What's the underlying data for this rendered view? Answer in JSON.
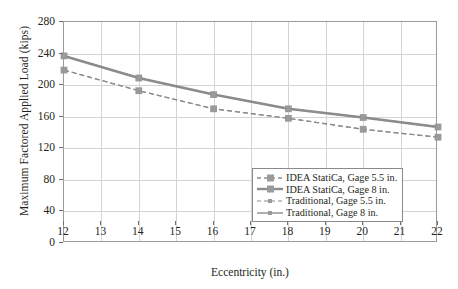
{
  "chart_data": {
    "type": "line",
    "title": "",
    "xlabel": "Eccentricity (in.)",
    "ylabel": "Maximum Factored Applied Load (kips)",
    "x": [
      12,
      14,
      16,
      18,
      20,
      22
    ],
    "xlim": [
      12,
      22
    ],
    "ylim": [
      0,
      280
    ],
    "xticks": [
      "12",
      "13",
      "14",
      "15",
      "16",
      "17",
      "18",
      "19",
      "20",
      "21",
      "22"
    ],
    "yticks": [
      "0",
      "40",
      "80",
      "120",
      "160",
      "200",
      "240",
      "280"
    ],
    "grid": true,
    "legend_position": "lower right",
    "series": [
      {
        "name": "IDEA StatiCa, Gage 5.5 in.",
        "values": [
          219,
          193,
          170,
          158,
          144,
          134
        ],
        "style": "dashed",
        "marker": "square",
        "color": "#8c8c8c",
        "width": 1.3
      },
      {
        "name": "IDEA StatiCa, Gage 8 in.",
        "values": [
          237,
          209,
          188,
          170,
          159,
          147
        ],
        "style": "solid",
        "marker": "square",
        "color": "#8c8c8c",
        "width": 2.6
      },
      {
        "name": "Traditional, Gage 5.5 in.",
        "values": [
          219,
          193,
          170,
          158,
          144,
          134
        ],
        "style": "dashed",
        "marker": "square-small",
        "color": "#8c8c8c",
        "width": 1.1
      },
      {
        "name": "Traditional, Gage 8 in.",
        "values": [
          237,
          209,
          188,
          170,
          159,
          147
        ],
        "style": "solid",
        "marker": "square-small",
        "color": "#8c8c8c",
        "width": 1.4
      }
    ]
  },
  "legend": {
    "items": [
      {
        "label": "IDEA StatiCa, Gage 5.5 in."
      },
      {
        "label": "IDEA StatiCa, Gage 8 in."
      },
      {
        "label": "Traditional, Gage 5.5 in."
      },
      {
        "label": "Traditional, Gage 8 in."
      }
    ]
  }
}
